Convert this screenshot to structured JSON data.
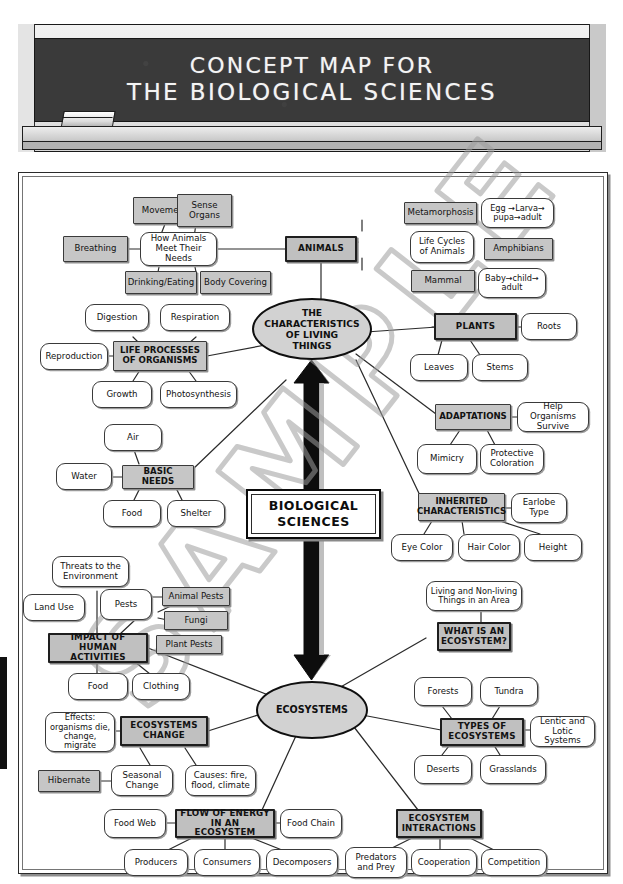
{
  "header": {
    "board_line_1": "CONCEPT MAP FOR",
    "board_line_2": "THE BIOLOGICAL SCIENCES",
    "eraser_icon": "chalk-eraser-icon",
    "chalk_icon": "chalk-stick-icon"
  },
  "watermark": {
    "text": "SAMPLE"
  },
  "center": {
    "root": "BIOLOGICAL\nSCIENCES",
    "hub_top": "THE\nCHARACTERISTICS\nOF LIVING\nTHINGS",
    "hub_bottom": "ECOSYSTEMS"
  },
  "nodes": {
    "movement": "Movement",
    "sense_organs": "Sense\nOrgans",
    "breathing": "Breathing",
    "how_animals_meet_needs": "How Animals\nMeet Their Needs",
    "drinking_eating": "Drinking/Eating",
    "body_covering": "Body Covering",
    "animals": "ANIMALS",
    "metamorphosis": "Metamorphosis",
    "egg_larva_pupa_adult": "Egg →Larva→\npupa→adult",
    "life_cycles_of_animals": "Life Cycles\nof Animals",
    "amphibians": "Amphibians",
    "mammal": "Mammal",
    "baby_child_adult": "Baby→child→\nadult",
    "plants": "PLANTS",
    "roots": "Roots",
    "leaves": "Leaves",
    "stems": "Stems",
    "digestion": "Digestion",
    "respiration": "Respiration",
    "reproduction": "Reproduction",
    "life_processes_of_organisms": "LIFE PROCESSES\nOF ORGANISMS",
    "growth": "Growth",
    "photosynthesis": "Photosynthesis",
    "air": "Air",
    "water": "Water",
    "basic_needs": "BASIC NEEDS",
    "food_basic": "Food",
    "shelter": "Shelter",
    "adaptations": "ADAPTATIONS",
    "help_organisms_survive": "Help Organisms\nSurvive",
    "mimicry": "Mimicry",
    "protective_coloration": "Protective\nColoration",
    "inherited_characteristics": "INHERITED\nCHARACTERISTICS",
    "earlobe_type": "Earlobe\nType",
    "eye_color": "Eye Color",
    "hair_color": "Hair Color",
    "height": "Height",
    "threats_to_environment": "Threats to the\nEnvironment",
    "land_use": "Land Use",
    "pests": "Pests",
    "animal_pests": "Animal Pests",
    "fungi": "Fungi",
    "plant_pests": "Plant Pests",
    "impact_of_human_activities": "IMPACT OF\nHUMAN ACTIVITIES",
    "food_impact": "Food",
    "clothing": "Clothing",
    "effects_organisms": "Effects:\norganisms die,\nchange, migrate",
    "ecosystems_change": "ECOSYSTEMS\nCHANGE",
    "hibernate": "Hibernate",
    "seasonal_change": "Seasonal\nChange",
    "causes_fire_flood_climate": "Causes: fire,\nflood, climate",
    "food_web": "Food Web",
    "flow_of_energy": "FLOW OF ENERGY\nIN AN ECOSYSTEM",
    "food_chain": "Food Chain",
    "producers": "Producers",
    "consumers": "Consumers",
    "decomposers": "Decomposers",
    "living_nonliving_things": "Living and Non-living\nThings in an Area",
    "what_is_an_ecosystem": "WHAT IS AN\nECOSYSTEM?",
    "forests": "Forests",
    "tundra": "Tundra",
    "types_of_ecosystems": "TYPES OF\nECOSYSTEMS",
    "lentic_lotic": "Lentic and\nLotic Systems",
    "deserts": "Deserts",
    "grasslands": "Grasslands",
    "ecosystem_interactions": "ECOSYSTEM\nINTERACTIONS",
    "predators_and_prey": "Predators\nand Prey",
    "cooperation": "Cooperation",
    "competition": "Competition"
  },
  "colors": {
    "hub_fill": "#c0c0c0",
    "gray_fill": "#c6c6c6",
    "leaf_fill": "#ffffff",
    "ellipse_fill": "#d2d2d2",
    "stroke": "#2b2b2b",
    "board": "#3a3a3a",
    "watermark": "#9a9a9a"
  }
}
